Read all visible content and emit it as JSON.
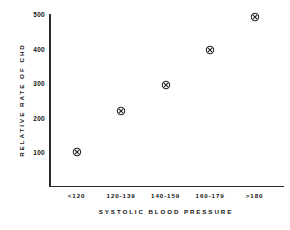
{
  "chart_data": {
    "type": "scatter",
    "title": "",
    "xlabel": "SYSTOLIC  BLOOD  PRESSURE",
    "ylabel": "RELATIVE   RATE   OF   CHD",
    "categories": [
      "<120",
      "120-139",
      "140-159",
      "160-179",
      ">180"
    ],
    "values": [
      100,
      220,
      295,
      395,
      490
    ],
    "series": [
      {
        "name": "Relative rate of CHD",
        "values": [
          100,
          220,
          295,
          395,
          490
        ]
      }
    ],
    "ylim": [
      0,
      500
    ],
    "yticks": [
      100,
      200,
      300,
      400,
      500
    ],
    "ytick_labels": [
      "100",
      "200",
      "300",
      "400",
      "500"
    ],
    "grid": false,
    "legend": false,
    "marker": "circle-with-x",
    "marker_color": "#222222",
    "axis_color": "#2b2b2b",
    "background": "#ffffff"
  },
  "axes": {
    "y_title": "RELATIVE   RATE   OF   CHD",
    "x_title": "SYSTOLIC  BLOOD  PRESSURE"
  }
}
